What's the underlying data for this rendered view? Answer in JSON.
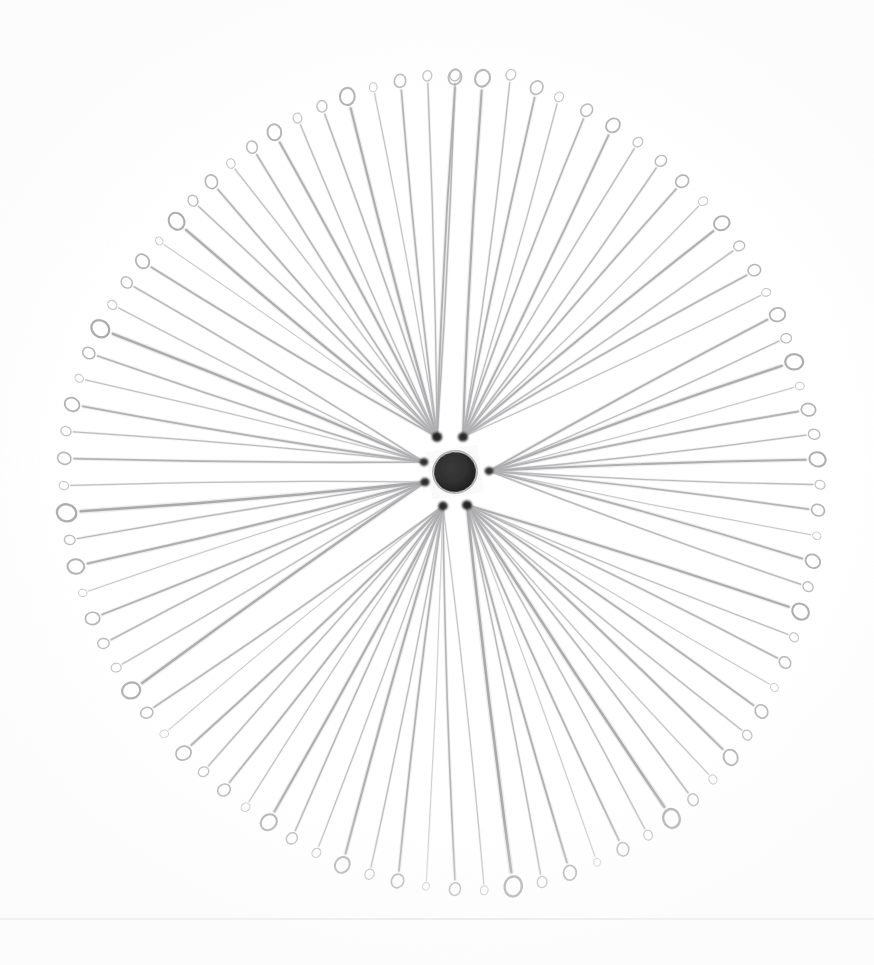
{
  "scene": {
    "title": "Radial arrangement of eye pins",
    "description": "A fan of thin wire eye pins radiating outward from a dark central hub, each pin ending in a small circular loop.",
    "background_color": "#ffffff",
    "width": 874,
    "height": 965
  },
  "hub": {
    "center_x": 455,
    "center_y": 472,
    "ellipse_rx": 21,
    "ellipse_ry": 20,
    "ellipse_rotation_deg": -8,
    "color": "#2e2e2e",
    "label": "central-dark-blob"
  },
  "anchors": [
    {
      "name": "anchor-top-left",
      "x": 437,
      "y": 437,
      "r": 5.2,
      "color": "#1f1f1f"
    },
    {
      "name": "anchor-top-right",
      "x": 463,
      "y": 437,
      "r": 5.0,
      "color": "#242424"
    },
    {
      "name": "anchor-left-upper",
      "x": 424,
      "y": 462,
      "r": 4.4,
      "color": "#2a2a2a"
    },
    {
      "name": "anchor-left-lower",
      "x": 425,
      "y": 482,
      "r": 4.6,
      "color": "#262626"
    },
    {
      "name": "anchor-right",
      "x": 489,
      "y": 471,
      "r": 4.4,
      "color": "#2b2b2b"
    },
    {
      "name": "anchor-bottom-left",
      "x": 443,
      "y": 506,
      "r": 4.8,
      "color": "#222222"
    },
    {
      "name": "anchor-bottom-right",
      "x": 467,
      "y": 505,
      "r": 5.0,
      "color": "#1d1d1d"
    }
  ],
  "pin_style": {
    "stroke_min": 1.0,
    "stroke_max": 2.6,
    "shaft_color_dark": "#8a8a8c",
    "shaft_color_light": "#d8d8da",
    "loop_color_dark": "#8f8f92",
    "loop_color_light": "#dcdcde",
    "loop_radius_min": 4.0,
    "loop_radius_max": 10.5
  },
  "geometry": {
    "pin_count": 88,
    "radius_min": 355,
    "radius_max": 425,
    "radius_left": 390,
    "radius_right": 368,
    "radius_top": 398,
    "radius_bottom": 420
  },
  "scan_line": {
    "name": "paper-edge-line",
    "y": 918,
    "color": "#e3e3e6",
    "thickness": 2,
    "opacity": 0.85
  },
  "pins": [
    {
      "angle": -90.0,
      "radius": 398,
      "shade": 0.52,
      "loop": 6.0,
      "stroke": 1.5,
      "anchor": 0,
      "bow": 3
    },
    {
      "angle": -86.0,
      "radius": 396,
      "shade": 0.4,
      "loop": 8.5,
      "stroke": 2.2,
      "anchor": 1,
      "bow": -4
    },
    {
      "angle": -82.0,
      "radius": 402,
      "shade": 0.58,
      "loop": 5.5,
      "stroke": 1.3,
      "anchor": 1,
      "bow": 5
    },
    {
      "angle": -78.0,
      "radius": 394,
      "shade": 0.46,
      "loop": 7.0,
      "stroke": 1.8,
      "anchor": 1,
      "bow": -3
    },
    {
      "angle": -74.5,
      "radius": 390,
      "shade": 0.62,
      "loop": 5.0,
      "stroke": 1.2,
      "anchor": 1,
      "bow": 4
    },
    {
      "angle": -70.0,
      "radius": 386,
      "shade": 0.5,
      "loop": 6.5,
      "stroke": 1.6,
      "anchor": 1,
      "bow": -5
    },
    {
      "angle": -65.5,
      "radius": 382,
      "shade": 0.44,
      "loop": 7.5,
      "stroke": 1.9,
      "anchor": 1,
      "bow": 3
    },
    {
      "angle": -61.0,
      "radius": 378,
      "shade": 0.6,
      "loop": 5.2,
      "stroke": 1.3,
      "anchor": 1,
      "bow": -4
    },
    {
      "angle": -56.5,
      "radius": 374,
      "shade": 0.54,
      "loop": 6.0,
      "stroke": 1.5,
      "anchor": 1,
      "bow": 4
    },
    {
      "angle": -52.0,
      "radius": 370,
      "shade": 0.48,
      "loop": 6.8,
      "stroke": 1.7,
      "anchor": 1,
      "bow": -3
    },
    {
      "angle": -47.5,
      "radius": 368,
      "shade": 0.64,
      "loop": 4.8,
      "stroke": 1.1,
      "anchor": 1,
      "bow": 5
    },
    {
      "angle": -43.0,
      "radius": 366,
      "shade": 0.42,
      "loop": 8.0,
      "stroke": 2.0,
      "anchor": 1,
      "bow": -4
    },
    {
      "angle": -38.5,
      "radius": 364,
      "shade": 0.56,
      "loop": 5.6,
      "stroke": 1.4,
      "anchor": 1,
      "bow": 3
    },
    {
      "angle": -34.0,
      "radius": 362,
      "shade": 0.5,
      "loop": 6.4,
      "stroke": 1.6,
      "anchor": 1,
      "bow": -5
    },
    {
      "angle": -30.0,
      "radius": 360,
      "shade": 0.66,
      "loop": 4.5,
      "stroke": 1.1,
      "anchor": 1,
      "bow": 4
    },
    {
      "angle": -26.0,
      "radius": 360,
      "shade": 0.45,
      "loop": 7.8,
      "stroke": 1.9,
      "anchor": 4,
      "bow": -3
    },
    {
      "angle": -22.0,
      "radius": 358,
      "shade": 0.58,
      "loop": 5.4,
      "stroke": 1.3,
      "anchor": 4,
      "bow": 4
    },
    {
      "angle": -18.0,
      "radius": 358,
      "shade": 0.38,
      "loop": 9.0,
      "stroke": 2.3,
      "anchor": 4,
      "bow": -4
    },
    {
      "angle": -14.0,
      "radius": 356,
      "shade": 0.68,
      "loop": 4.4,
      "stroke": 1.0,
      "anchor": 4,
      "bow": 3
    },
    {
      "angle": -10.0,
      "radius": 360,
      "shade": 0.47,
      "loop": 7.2,
      "stroke": 1.8,
      "anchor": 4,
      "bow": -4
    },
    {
      "angle": -6.0,
      "radius": 362,
      "shade": 0.55,
      "loop": 5.8,
      "stroke": 1.4,
      "anchor": 4,
      "bow": 4
    },
    {
      "angle": -2.0,
      "radius": 364,
      "shade": 0.41,
      "loop": 8.2,
      "stroke": 2.1,
      "anchor": 4,
      "bow": -3
    },
    {
      "angle": 2.0,
      "radius": 366,
      "shade": 0.6,
      "loop": 5.0,
      "stroke": 1.3,
      "anchor": 4,
      "bow": 4
    },
    {
      "angle": 6.0,
      "radius": 366,
      "shade": 0.49,
      "loop": 6.6,
      "stroke": 1.7,
      "anchor": 4,
      "bow": -4
    },
    {
      "angle": 10.0,
      "radius": 368,
      "shade": 0.72,
      "loop": 4.2,
      "stroke": 1.0,
      "anchor": 4,
      "bow": 3
    },
    {
      "angle": 14.0,
      "radius": 370,
      "shade": 0.44,
      "loop": 7.6,
      "stroke": 1.9,
      "anchor": 4,
      "bow": -5
    },
    {
      "angle": 18.0,
      "radius": 372,
      "shade": 0.57,
      "loop": 5.4,
      "stroke": 1.4,
      "anchor": 4,
      "bow": 4
    },
    {
      "angle": 22.0,
      "radius": 374,
      "shade": 0.39,
      "loop": 8.8,
      "stroke": 2.2,
      "anchor": 6,
      "bow": -3
    },
    {
      "angle": 26.0,
      "radius": 378,
      "shade": 0.63,
      "loop": 4.8,
      "stroke": 1.2,
      "anchor": 6,
      "bow": 4
    },
    {
      "angle": 30.0,
      "radius": 382,
      "shade": 0.51,
      "loop": 6.2,
      "stroke": 1.6,
      "anchor": 6,
      "bow": -4
    },
    {
      "angle": 34.0,
      "radius": 386,
      "shade": 0.7,
      "loop": 4.3,
      "stroke": 1.0,
      "anchor": 6,
      "bow": 3
    },
    {
      "angle": 38.0,
      "radius": 390,
      "shade": 0.46,
      "loop": 7.0,
      "stroke": 1.8,
      "anchor": 6,
      "bow": -4
    },
    {
      "angle": 42.0,
      "radius": 394,
      "shade": 0.59,
      "loop": 5.2,
      "stroke": 1.3,
      "anchor": 6,
      "bow": 4
    },
    {
      "angle": 46.0,
      "radius": 398,
      "shade": 0.43,
      "loop": 8.0,
      "stroke": 2.0,
      "anchor": 6,
      "bow": -3
    },
    {
      "angle": 50.0,
      "radius": 402,
      "shade": 0.66,
      "loop": 4.6,
      "stroke": 1.1,
      "anchor": 6,
      "bow": 5
    },
    {
      "angle": 54.0,
      "radius": 406,
      "shade": 0.53,
      "loop": 6.0,
      "stroke": 1.5,
      "anchor": 6,
      "bow": -4
    },
    {
      "angle": 58.0,
      "radius": 410,
      "shade": 0.37,
      "loop": 9.5,
      "stroke": 2.5,
      "anchor": 6,
      "bow": 3
    },
    {
      "angle": 62.0,
      "radius": 412,
      "shade": 0.61,
      "loop": 5.0,
      "stroke": 1.3,
      "anchor": 6,
      "bow": -4
    },
    {
      "angle": 66.0,
      "radius": 414,
      "shade": 0.48,
      "loop": 6.8,
      "stroke": 1.7,
      "anchor": 6,
      "bow": 4
    },
    {
      "angle": 70.0,
      "radius": 416,
      "shade": 0.74,
      "loop": 4.0,
      "stroke": 1.0,
      "anchor": 6,
      "bow": -3
    },
    {
      "angle": 74.0,
      "radius": 418,
      "shade": 0.45,
      "loop": 7.4,
      "stroke": 1.9,
      "anchor": 6,
      "bow": 4
    },
    {
      "angle": 78.0,
      "radius": 420,
      "shade": 0.56,
      "loop": 5.6,
      "stroke": 1.4,
      "anchor": 6,
      "bow": -4
    },
    {
      "angle": 82.0,
      "radius": 420,
      "shade": 0.35,
      "loop": 10.0,
      "stroke": 2.6,
      "anchor": 6,
      "bow": 3
    },
    {
      "angle": 86.0,
      "radius": 420,
      "shade": 0.68,
      "loop": 4.5,
      "stroke": 1.1,
      "anchor": 5,
      "bow": -4
    },
    {
      "angle": 90.0,
      "radius": 418,
      "shade": 0.5,
      "loop": 6.4,
      "stroke": 1.6,
      "anchor": 5,
      "bow": 4
    },
    {
      "angle": 94.0,
      "radius": 416,
      "shade": 0.78,
      "loop": 3.9,
      "stroke": 0.9,
      "anchor": 5,
      "bow": -3
    },
    {
      "angle": 98.0,
      "radius": 414,
      "shade": 0.47,
      "loop": 7.0,
      "stroke": 1.8,
      "anchor": 5,
      "bow": 4
    },
    {
      "angle": 102.0,
      "radius": 412,
      "shade": 0.6,
      "loop": 5.2,
      "stroke": 1.3,
      "anchor": 5,
      "bow": -4
    },
    {
      "angle": 106.0,
      "radius": 410,
      "shade": 0.42,
      "loop": 8.2,
      "stroke": 2.1,
      "anchor": 5,
      "bow": 3
    },
    {
      "angle": 110.0,
      "radius": 406,
      "shade": 0.64,
      "loop": 4.8,
      "stroke": 1.2,
      "anchor": 5,
      "bow": -4
    },
    {
      "angle": 114.0,
      "radius": 402,
      "shade": 0.52,
      "loop": 6.0,
      "stroke": 1.5,
      "anchor": 5,
      "bow": 4
    },
    {
      "angle": 118.0,
      "radius": 398,
      "shade": 0.4,
      "loop": 8.6,
      "stroke": 2.2,
      "anchor": 5,
      "bow": -3
    },
    {
      "angle": 122.0,
      "radius": 396,
      "shade": 0.67,
      "loop": 4.6,
      "stroke": 1.1,
      "anchor": 5,
      "bow": 4
    },
    {
      "angle": 126.0,
      "radius": 394,
      "shade": 0.49,
      "loop": 6.6,
      "stroke": 1.7,
      "anchor": 5,
      "bow": -4
    },
    {
      "angle": 130.0,
      "radius": 392,
      "shade": 0.58,
      "loop": 5.4,
      "stroke": 1.4,
      "anchor": 5,
      "bow": 3
    },
    {
      "angle": 134.0,
      "radius": 392,
      "shade": 0.44,
      "loop": 7.8,
      "stroke": 1.9,
      "anchor": 5,
      "bow": -5
    },
    {
      "angle": 138.0,
      "radius": 392,
      "shade": 0.7,
      "loop": 4.4,
      "stroke": 1.0,
      "anchor": 5,
      "bow": 4
    },
    {
      "angle": 142.0,
      "radius": 392,
      "shade": 0.51,
      "loop": 6.2,
      "stroke": 1.6,
      "anchor": 5,
      "bow": -4
    },
    {
      "angle": 146.0,
      "radius": 392,
      "shade": 0.38,
      "loop": 9.2,
      "stroke": 2.4,
      "anchor": 3,
      "bow": 3
    },
    {
      "angle": 150.0,
      "radius": 392,
      "shade": 0.62,
      "loop": 5.0,
      "stroke": 1.3,
      "anchor": 3,
      "bow": -4
    },
    {
      "angle": 154.0,
      "radius": 392,
      "shade": 0.54,
      "loop": 5.8,
      "stroke": 1.5,
      "anchor": 3,
      "bow": 4
    },
    {
      "angle": 158.0,
      "radius": 392,
      "shade": 0.46,
      "loop": 7.2,
      "stroke": 1.8,
      "anchor": 3,
      "bow": -3
    },
    {
      "angle": 162.0,
      "radius": 392,
      "shade": 0.71,
      "loop": 4.2,
      "stroke": 1.0,
      "anchor": 3,
      "bow": 4
    },
    {
      "angle": 166.0,
      "radius": 392,
      "shade": 0.41,
      "loop": 8.4,
      "stroke": 2.1,
      "anchor": 3,
      "bow": -4
    },
    {
      "angle": 170.0,
      "radius": 392,
      "shade": 0.57,
      "loop": 5.4,
      "stroke": 1.4,
      "anchor": 3,
      "bow": 3
    },
    {
      "angle": 174.0,
      "radius": 392,
      "shade": 0.34,
      "loop": 9.8,
      "stroke": 2.5,
      "anchor": 3,
      "bow": -4
    },
    {
      "angle": 178.0,
      "radius": 392,
      "shade": 0.66,
      "loop": 4.7,
      "stroke": 1.2,
      "anchor": 3,
      "bow": 4
    },
    {
      "angle": 182.0,
      "radius": 392,
      "shade": 0.48,
      "loop": 6.8,
      "stroke": 1.7,
      "anchor": 2,
      "bow": -3
    },
    {
      "angle": 186.0,
      "radius": 392,
      "shade": 0.59,
      "loop": 5.2,
      "stroke": 1.3,
      "anchor": 2,
      "bow": 4
    },
    {
      "angle": 190.0,
      "radius": 390,
      "shade": 0.43,
      "loop": 7.6,
      "stroke": 1.9,
      "anchor": 2,
      "bow": -4
    },
    {
      "angle": 194.0,
      "radius": 388,
      "shade": 0.69,
      "loop": 4.4,
      "stroke": 1.1,
      "anchor": 2,
      "bow": 3
    },
    {
      "angle": 198.0,
      "radius": 386,
      "shade": 0.5,
      "loop": 6.4,
      "stroke": 1.6,
      "anchor": 2,
      "bow": -4
    },
    {
      "angle": 202.0,
      "radius": 384,
      "shade": 0.36,
      "loop": 9.4,
      "stroke": 2.4,
      "anchor": 2,
      "bow": 4
    },
    {
      "angle": 206.0,
      "radius": 382,
      "shade": 0.63,
      "loop": 4.9,
      "stroke": 1.2,
      "anchor": 2,
      "bow": -3
    },
    {
      "angle": 210.0,
      "radius": 380,
      "shade": 0.53,
      "loop": 6.0,
      "stroke": 1.5,
      "anchor": 2,
      "bow": 4
    },
    {
      "angle": 214.0,
      "radius": 378,
      "shade": 0.45,
      "loop": 7.4,
      "stroke": 1.8,
      "anchor": 0,
      "bow": -4
    },
    {
      "angle": 218.0,
      "radius": 376,
      "shade": 0.72,
      "loop": 4.1,
      "stroke": 1.0,
      "anchor": 0,
      "bow": 3
    },
    {
      "angle": 222.0,
      "radius": 376,
      "shade": 0.39,
      "loop": 8.8,
      "stroke": 2.2,
      "anchor": 0,
      "bow": -4
    },
    {
      "angle": 226.0,
      "radius": 378,
      "shade": 0.56,
      "loop": 5.6,
      "stroke": 1.4,
      "anchor": 0,
      "bow": 4
    },
    {
      "angle": 230.0,
      "radius": 380,
      "shade": 0.47,
      "loop": 7.0,
      "stroke": 1.7,
      "anchor": 0,
      "bow": -3
    },
    {
      "angle": 234.0,
      "radius": 382,
      "shade": 0.65,
      "loop": 4.8,
      "stroke": 1.2,
      "anchor": 0,
      "bow": 4
    },
    {
      "angle": 238.0,
      "radius": 384,
      "shade": 0.51,
      "loop": 6.2,
      "stroke": 1.6,
      "anchor": 0,
      "bow": -4
    },
    {
      "angle": 242.0,
      "radius": 386,
      "shade": 0.42,
      "loop": 8.0,
      "stroke": 2.0,
      "anchor": 0,
      "bow": 3
    },
    {
      "angle": 246.0,
      "radius": 388,
      "shade": 0.61,
      "loop": 5.0,
      "stroke": 1.3,
      "anchor": 0,
      "bow": -4
    },
    {
      "angle": 250.0,
      "radius": 390,
      "shade": 0.55,
      "loop": 5.8,
      "stroke": 1.5,
      "anchor": 0,
      "bow": 4
    },
    {
      "angle": 254.0,
      "radius": 392,
      "shade": 0.4,
      "loop": 8.6,
      "stroke": 2.2,
      "anchor": 0,
      "bow": -3
    },
    {
      "angle": 258.0,
      "radius": 394,
      "shade": 0.67,
      "loop": 4.5,
      "stroke": 1.1,
      "anchor": 0,
      "bow": 4
    },
    {
      "angle": 262.0,
      "radius": 396,
      "shade": 0.49,
      "loop": 6.6,
      "stroke": 1.7,
      "anchor": 0,
      "bow": -4
    },
    {
      "angle": 266.0,
      "radius": 398,
      "shade": 0.58,
      "loop": 5.2,
      "stroke": 1.4,
      "anchor": 0,
      "bow": 3
    },
    {
      "angle": 270.0,
      "radius": 396,
      "shade": 0.44,
      "loop": 7.5,
      "stroke": 1.9,
      "anchor": 0,
      "bow": -4
    }
  ]
}
